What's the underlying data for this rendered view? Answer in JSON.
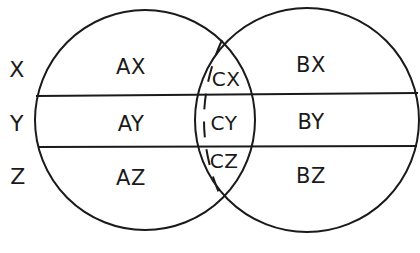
{
  "diagram": {
    "type": "venn",
    "circles": [
      {
        "name": "A",
        "cx": 145,
        "cy": 120,
        "r": 110
      },
      {
        "name": "B",
        "cx": 307,
        "cy": 120,
        "r": 112
      }
    ],
    "dashed_arc": {
      "description": "dashed boundary inside intersection region"
    },
    "horizontal_lines_y": [
      95,
      147
    ],
    "row_labels": {
      "x": "X",
      "y": "Y",
      "z": "Z"
    },
    "regions": {
      "ax": "AX",
      "ay": "AY",
      "az": "AZ",
      "cx": "CX",
      "cy": "CY",
      "cz": "CZ",
      "bx": "BX",
      "by": "BY",
      "bz": "BZ"
    },
    "stroke_color": "#1a1a1a",
    "background_color": "#ffffff"
  }
}
